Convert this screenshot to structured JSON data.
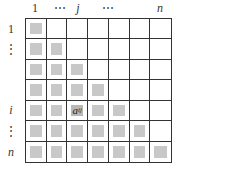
{
  "column_labels": [
    {
      "text": "1",
      "x": 25,
      "italic": false
    },
    {
      "text": "⋯",
      "x": 50,
      "italic": false
    },
    {
      "text": "j",
      "x": 68,
      "italic": true
    },
    {
      "text": "⋯",
      "x": 98,
      "italic": false
    },
    {
      "text": "n",
      "x": 150,
      "italic": true
    }
  ],
  "row_labels": [
    {
      "text": "1",
      "y": 22,
      "italic": false
    },
    {
      "text": "⋮",
      "y": 42,
      "italic": false
    },
    {
      "text": "i",
      "y": 103,
      "italic": true
    },
    {
      "text": "⋮",
      "y": 124,
      "italic": false
    },
    {
      "text": "n",
      "y": 145,
      "italic": true
    }
  ],
  "matrix": {
    "size": 7,
    "type": "lower-triangular",
    "filled_color": "#c8c8c8",
    "highlight": {
      "row": 4,
      "col": 2,
      "label": "aij"
    }
  }
}
